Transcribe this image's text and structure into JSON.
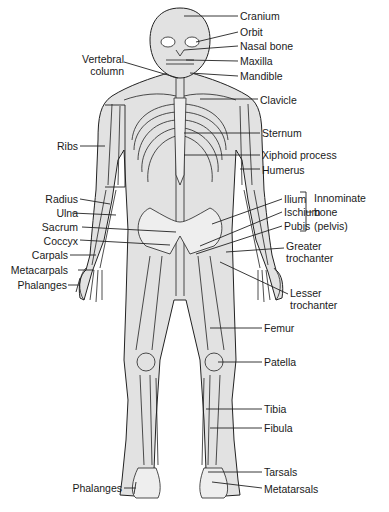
{
  "diagram": {
    "colors": {
      "bone_fill": "#e2e2e2",
      "outline": "#222222",
      "text": "#1a1a1a",
      "background": "#ffffff"
    },
    "labels_right": {
      "cranium": "Cranium",
      "orbit": "Orbit",
      "nasal_bone": "Nasal bone",
      "maxilla": "Maxilla",
      "mandible": "Mandible",
      "clavicle": "Clavicle",
      "sternum": "Sternum",
      "xiphoid": "Xiphoid process",
      "humerus": "Humerus",
      "ilium": "Ilium",
      "ischium": "Ischium",
      "pubis": "Pubis",
      "innominate_1": "Innominate",
      "innominate_2": "bone",
      "innominate_3": "(pelvis)",
      "greater_troch_1": "Greater",
      "greater_troch_2": "trochanter",
      "lesser_troch_1": "Lesser",
      "lesser_troch_2": "trochanter",
      "femur": "Femur",
      "patella": "Patella",
      "tibia": "Tibia",
      "fibula": "Fibula",
      "tarsals": "Tarsals",
      "metatarsals": "Metatarsals"
    },
    "labels_left": {
      "vertebral_1": "Vertebral",
      "vertebral_2": "column",
      "ribs": "Ribs",
      "radius": "Radius",
      "ulna": "Ulna",
      "sacrum": "Sacrum",
      "coccyx": "Coccyx",
      "carpals": "Carpals",
      "metacarpals": "Metacarpals",
      "phalanges_hand": "Phalanges",
      "phalanges_foot": "Phalanges"
    }
  }
}
